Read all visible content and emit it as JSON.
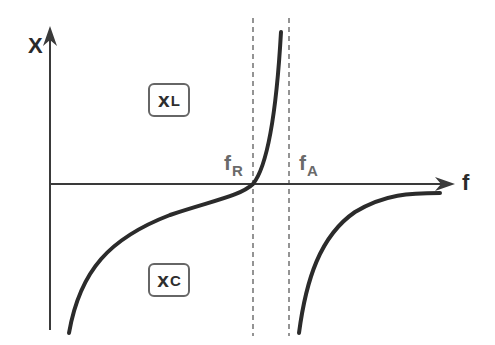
{
  "diagram": {
    "y_axis": {
      "label": "X"
    },
    "x_axis": {
      "label": "f"
    },
    "markers": [
      {
        "symbol": "f",
        "subscript": "R",
        "meaning": "resonance frequency"
      },
      {
        "symbol": "f",
        "subscript": "A",
        "meaning": "anti-resonance frequency"
      }
    ],
    "regions": [
      {
        "symbol": "X",
        "subscript": "L",
        "meaning": "inductive reactance (above axis)"
      },
      {
        "symbol": "X",
        "subscript": "C",
        "meaning": "capacitive reactance (below axis)"
      }
    ],
    "colors": {
      "curve": "#2b2b2b",
      "axis": "#3a3a3a",
      "dashed": "#7a7a7a",
      "box_border": "#666666",
      "marker_text": "#6a6a6a"
    }
  },
  "labels": {
    "y": "X",
    "x": "f",
    "fR_main": "f",
    "fR_sub": "R",
    "fA_main": "f",
    "fA_sub": "A",
    "xl_main": "x",
    "xl_sub": "L",
    "xc_main": "x",
    "xc_sub": "C"
  }
}
